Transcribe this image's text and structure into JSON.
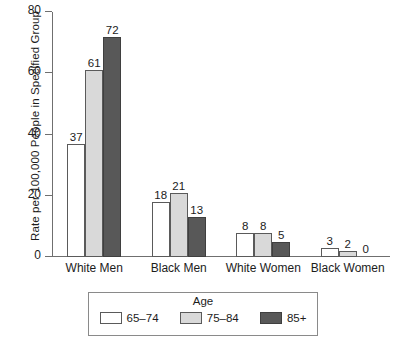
{
  "chart_data": {
    "type": "bar",
    "title": "",
    "subtitle": "",
    "xlabel": "",
    "ylabel": "Rate per 100,000 People in Specified Group",
    "ylim": [
      0,
      80
    ],
    "yticks": [
      0,
      20,
      40,
      60,
      80
    ],
    "ytick_labels": [
      "0",
      "20",
      "40",
      "60",
      "80"
    ],
    "grid": false,
    "legend_position": "bottom",
    "legend_title": "Age",
    "categories": [
      "White Men",
      "Black Men",
      "White Women",
      "Black Women"
    ],
    "series": [
      {
        "name": "65–74",
        "color": "#ffffff",
        "values": [
          37,
          18,
          8,
          3
        ]
      },
      {
        "name": "75–84",
        "color": "#d9d9d9",
        "values": [
          61,
          21,
          8,
          2
        ]
      },
      {
        "name": "85+",
        "color": "#585858",
        "values": [
          72,
          13,
          5,
          0
        ]
      }
    ],
    "value_labels": [
      [
        "37",
        "61",
        "72"
      ],
      [
        "18",
        "21",
        "13"
      ],
      [
        "8",
        "8",
        "5"
      ],
      [
        "3",
        "2",
        "0"
      ]
    ],
    "axis_color": "#6f6f6f",
    "bar_border_color": "#5a5a5a",
    "text_color": "#1c1c1c",
    "background": "#ffffff"
  }
}
